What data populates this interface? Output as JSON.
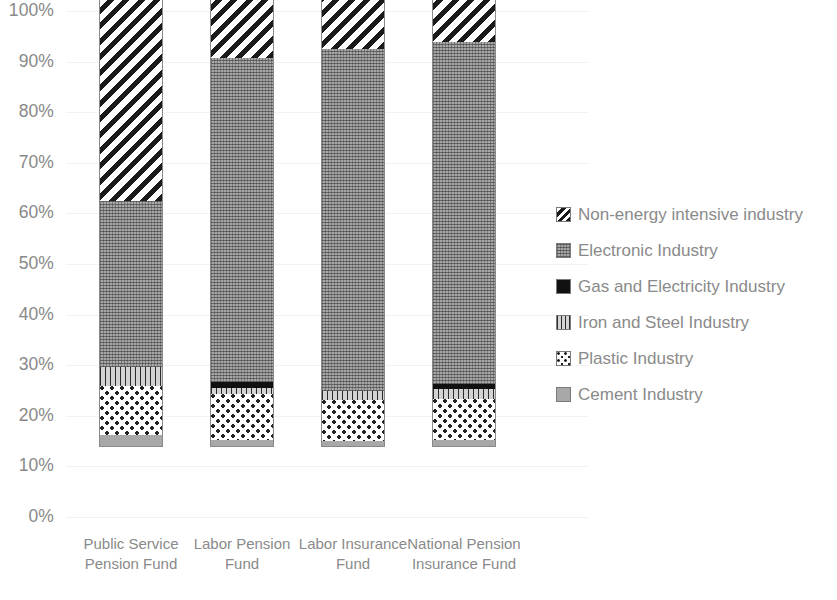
{
  "chart_data": {
    "type": "bar",
    "subtype": "stacked-100-percent",
    "title": "",
    "xlabel": "",
    "ylabel": "",
    "ylim": [
      0,
      100
    ],
    "y_tick_labels": [
      "100%",
      "90%",
      "80%",
      "70%",
      "60%",
      "50%",
      "40%",
      "30%",
      "20%",
      "10%",
      "0%"
    ],
    "y_tick_values": [
      100,
      90,
      80,
      70,
      60,
      50,
      40,
      30,
      20,
      10,
      0
    ],
    "grid": true,
    "grid_axis": "y",
    "legend_position": "right",
    "categories": [
      "Public Service Pension Fund",
      "Labor Pension Fund",
      "Labor Insurance Fund",
      "National Pension Insurance Fund"
    ],
    "series": [
      {
        "name": "Cement Industry",
        "pattern": "solid-light-gray",
        "color": "#a8a8a8",
        "values": [
          2.4,
          1.3,
          1.2,
          1.4
        ]
      },
      {
        "name": "Plastic Industry",
        "pattern": "speckle-dots",
        "color": "#ffffff",
        "values": [
          9.6,
          9.2,
          8.1,
          8.0
        ]
      },
      {
        "name": "Iron and Steel Industry",
        "pattern": "vertical-lines",
        "color": "#d4d4d4",
        "values": [
          3.8,
          1.2,
          1.8,
          2.0
        ]
      },
      {
        "name": "Gas and Electricity Industry",
        "pattern": "solid-black",
        "color": "#111111",
        "values": [
          0.0,
          1.2,
          0.0,
          1.0
        ]
      },
      {
        "name": "Electronic Industry",
        "pattern": "dense-gray-texture",
        "color": "#8f8f8f",
        "values": [
          32.8,
          63.9,
          67.5,
          67.6
        ]
      },
      {
        "name": "Non-energy intensive industry",
        "pattern": "diagonal-hatch",
        "color": "#ffffff",
        "values": [
          51.4,
          23.2,
          21.4,
          20.0
        ]
      }
    ]
  },
  "legend": {
    "items": [
      {
        "label": "Non-energy intensive industry",
        "swatch": "fill-nonenergy"
      },
      {
        "label": "Electronic Industry",
        "swatch": "fill-electronic"
      },
      {
        "label": "Gas and Electricity Industry",
        "swatch": "fill-gas"
      },
      {
        "label": "Iron and Steel Industry",
        "swatch": "fill-iron"
      },
      {
        "label": "Plastic Industry",
        "swatch": "fill-plastic"
      },
      {
        "label": "Cement Industry",
        "swatch": "fill-cement"
      }
    ]
  }
}
